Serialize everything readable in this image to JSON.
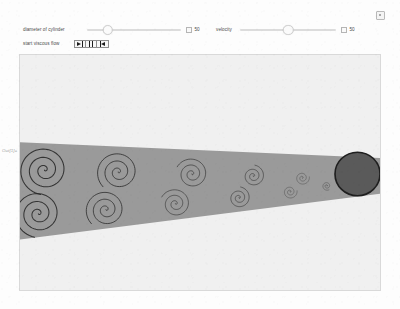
{
  "window": {
    "corner_icon": "window-resize-icon"
  },
  "margin": {
    "out_label": "Out[1]="
  },
  "controls": {
    "diameter": {
      "label": "diameter of cylinder",
      "value": "50",
      "min": 0,
      "max": 100,
      "knob_percent": 22,
      "toggle_icon": "value-box-toggle-icon"
    },
    "velocity": {
      "label": "velocity",
      "value": "50",
      "min": 0,
      "max": 100,
      "knob_percent": 50,
      "toggle_icon": "value-box-toggle-icon"
    },
    "animator": {
      "label": "start viscous flow",
      "play_label": "▶",
      "pause_label": "❚❚",
      "step_label": "❚◀",
      "play_icon": "play-icon",
      "pause_icon": "pause-icon",
      "step_icon": "step-icon"
    }
  },
  "simulation": {
    "name": "karman-vortex-street",
    "background_color": "#f0f0f0",
    "wake_color": "#9a9a9a",
    "wake_outline": "none",
    "cylinder_color": "#5a5a5a",
    "cylinder_outline_color": "#1f1f1f",
    "spiral_color": "#2b2b2b",
    "cylinder": {
      "cx": 330,
      "cy": 120,
      "r": 22
    },
    "wake_wedge": {
      "description": "triangular wake widening from cylinder toward the left outflow",
      "top_left_y": 88,
      "bottom_left_y": 186,
      "top_right_y": 104,
      "bottom_right_y": 140,
      "left_x": 0,
      "right_x": 352
    },
    "vortices": [
      {
        "cx": 24,
        "cy": 116,
        "r": 25,
        "turns": 3.0,
        "spin": "ccw",
        "row": "top"
      },
      {
        "cx": 96,
        "cy": 118,
        "r": 21,
        "turns": 2.9,
        "spin": "ccw",
        "row": "top"
      },
      {
        "cx": 168,
        "cy": 120,
        "r": 16,
        "turns": 2.7,
        "spin": "ccw",
        "row": "top"
      },
      {
        "cx": 228,
        "cy": 122,
        "r": 11,
        "turns": 2.5,
        "spin": "ccw",
        "row": "top"
      },
      {
        "cx": 276,
        "cy": 124,
        "r": 7,
        "turns": 2.3,
        "spin": "ccw",
        "row": "top"
      },
      {
        "cx": 18,
        "cy": 160,
        "r": 24,
        "turns": 3.0,
        "spin": "ccw",
        "row": "bottom"
      },
      {
        "cx": 84,
        "cy": 156,
        "r": 20,
        "turns": 2.9,
        "spin": "ccw",
        "row": "bottom"
      },
      {
        "cx": 152,
        "cy": 150,
        "r": 15,
        "turns": 2.7,
        "spin": "ccw",
        "row": "bottom"
      },
      {
        "cx": 214,
        "cy": 144,
        "r": 11,
        "turns": 2.5,
        "spin": "ccw",
        "row": "bottom"
      },
      {
        "cx": 264,
        "cy": 138,
        "r": 7,
        "turns": 2.3,
        "spin": "ccw",
        "row": "bottom"
      },
      {
        "cx": 300,
        "cy": 132,
        "r": 4.5,
        "turns": 2.1,
        "spin": "ccw",
        "row": "bottom"
      }
    ]
  }
}
